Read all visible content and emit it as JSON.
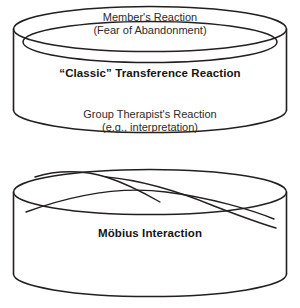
{
  "figure": {
    "name": "transference-mobius-diagram",
    "background_color": "#ffffff",
    "stroke_color": "#231f20",
    "diagrams": [
      {
        "id": "classic-transference-cylinder",
        "shape": "cylinder-band",
        "labels": {
          "outer_top": {
            "line1": "Member's Reaction",
            "line2": "(Fear of Abandonment)"
          },
          "inner_center": "“Classic” Transference Reaction",
          "outer_bottom": {
            "line1": "Group Therapist's Reaction",
            "line2": "(e.g., interpretation)"
          }
        }
      },
      {
        "id": "mobius-interaction-cylinder",
        "shape": "mobius-band-cylinder",
        "labels": {
          "center": "Möbius Interaction"
        }
      }
    ]
  }
}
